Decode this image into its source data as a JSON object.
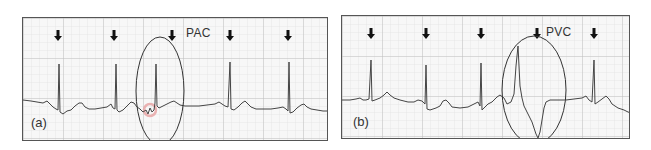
{
  "figure": {
    "panels": [
      {
        "id": "a",
        "label": "(a)",
        "annotation": "PAC",
        "annotation_meaning": "Premature Atrial Contraction",
        "beat_markers": 5
      },
      {
        "id": "b",
        "label": "(b)",
        "annotation": "PVC",
        "annotation_meaning": "Premature Ventricular Contraction",
        "beat_markers": 5
      }
    ],
    "colors": {
      "grid": "#c8c8c8",
      "trace": "#444444",
      "border": "#555555",
      "highlight": "#e6a0a0"
    }
  }
}
